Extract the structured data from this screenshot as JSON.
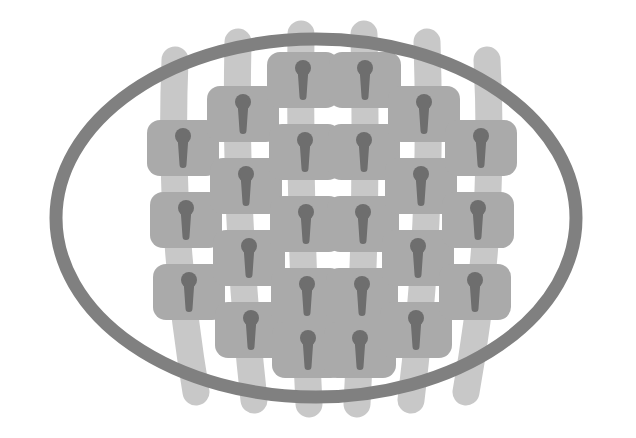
{
  "figure": {
    "title": "Implant Array Within Elliptical Frame",
    "canvas": {
      "width": 636,
      "height": 438,
      "background": "#ffffff"
    }
  },
  "colors": {
    "background": "#ffffff",
    "ring_stroke": "#808080",
    "band_fill": "#c8c8c8",
    "plate_fill": "#aaaaaa",
    "keyhole_fill": "#6e6e6e"
  },
  "ellipse": {
    "name": "outer-elliptical-ring",
    "center_x": 316,
    "center_y": 218,
    "radius_x": 260,
    "radius_y": 179,
    "stroke_width": 13,
    "fill": "none"
  },
  "geometry": {
    "plate_width": 72,
    "plate_height": 56,
    "plate_corner_radius": 13,
    "band_width": 27,
    "band_corner_radius": 13,
    "keyhole": {
      "head_radius": 8,
      "neck_top_width": 11,
      "neck_bottom_width": 7,
      "total_height": 40
    },
    "row_pitch": 72,
    "column_pitch": 78
  },
  "columns": [
    {
      "index": 1,
      "name": "implant-column-1",
      "plate_count": 3,
      "band_top_x": 175,
      "band_top_y": 60,
      "band_bottom_x": 196,
      "band_bottom_y": 392,
      "band_curve_x": 168,
      "first_plate_center_y": 148,
      "plate_center_xs": [
        183,
        186,
        189
      ],
      "plate_center_ys": [
        148,
        220,
        292
      ]
    },
    {
      "index": 2,
      "name": "implant-column-2",
      "plate_count": 4,
      "band_top_x": 238,
      "band_top_y": 42,
      "band_bottom_x": 254,
      "band_bottom_y": 400,
      "band_curve_x": 234,
      "first_plate_center_y": 114,
      "plate_center_xs": [
        243,
        246,
        249,
        251
      ],
      "plate_center_ys": [
        114,
        186,
        258,
        330
      ]
    },
    {
      "index": 3,
      "name": "implant-column-3",
      "plate_count": 5,
      "band_top_x": 301,
      "band_top_y": 34,
      "band_bottom_x": 309,
      "band_bottom_y": 404,
      "band_curve_x": 299,
      "first_plate_center_y": 80,
      "plate_center_xs": [
        303,
        305,
        306,
        307,
        308
      ],
      "plate_center_ys": [
        80,
        152,
        224,
        296,
        350
      ]
    },
    {
      "index": 4,
      "name": "implant-column-4",
      "plate_count": 5,
      "band_top_x": 364,
      "band_top_y": 34,
      "band_bottom_x": 357,
      "band_bottom_y": 404,
      "band_curve_x": 368,
      "first_plate_center_y": 80,
      "plate_center_xs": [
        365,
        364,
        363,
        362,
        360
      ],
      "plate_center_ys": [
        80,
        152,
        224,
        296,
        350
      ]
    },
    {
      "index": 5,
      "name": "implant-column-5",
      "plate_count": 4,
      "band_top_x": 427,
      "band_top_y": 42,
      "band_bottom_x": 411,
      "band_bottom_y": 400,
      "band_curve_x": 433,
      "first_plate_center_y": 114,
      "plate_center_xs": [
        424,
        421,
        418,
        416
      ],
      "plate_center_ys": [
        114,
        186,
        258,
        330
      ]
    },
    {
      "index": 6,
      "name": "implant-column-6",
      "plate_count": 3,
      "band_top_x": 487,
      "band_top_y": 60,
      "band_bottom_x": 466,
      "band_bottom_y": 392,
      "band_curve_x": 496,
      "first_plate_center_y": 148,
      "plate_center_xs": [
        481,
        478,
        475
      ],
      "plate_center_ys": [
        148,
        220,
        292
      ]
    }
  ],
  "summary": {
    "column_count": 6,
    "plates_per_column": [
      3,
      4,
      5,
      5,
      4,
      3
    ],
    "total_plates": 24
  }
}
